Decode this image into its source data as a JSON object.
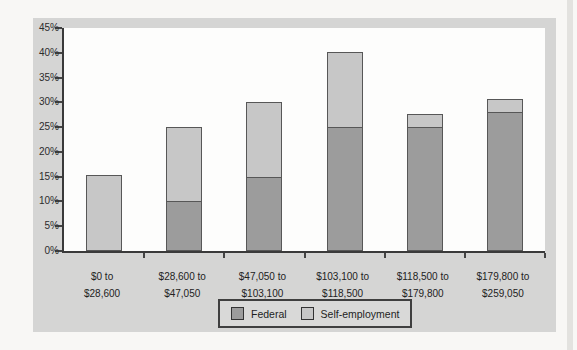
{
  "colors": {
    "panel_bg": "#d5d5d4",
    "plot_bg": "#fdfdfc",
    "axis": "#3a3a3a",
    "federal": "#9c9c9c",
    "self_employment": "#c7c7c7",
    "text": "#222222"
  },
  "chart_data": {
    "type": "bar",
    "stacked": true,
    "title": "",
    "xlabel": "",
    "ylabel": "",
    "ylim": [
      0,
      45
    ],
    "y_step": 5,
    "grid": false,
    "legend_position": "bottom-center",
    "y_tick_labels": [
      "45%",
      "40%",
      "35%",
      "30%",
      "25%",
      "20%",
      "15%",
      "10%",
      "5%",
      "0%"
    ],
    "categories": [
      {
        "line1": "$0 to",
        "line2": "$28,600"
      },
      {
        "line1": "$28,600 to",
        "line2": "$47,050"
      },
      {
        "line1": "$47,050 to",
        "line2": "$103,100"
      },
      {
        "line1": "$103,100 to",
        "line2": "$118,500"
      },
      {
        "line1": "$118,500 to",
        "line2": "$179,800"
      },
      {
        "line1": "$179,800 to",
        "line2": "$259,050"
      }
    ],
    "series": [
      {
        "name": "Federal",
        "color": "#9c9c9c",
        "values": [
          0,
          10,
          15,
          25,
          25,
          28
        ]
      },
      {
        "name": "Self-employment",
        "color": "#c7c7c7",
        "values": [
          15.3,
          15.3,
          15.3,
          15.3,
          2.9,
          2.9
        ]
      }
    ],
    "totals": [
      15.3,
      25.3,
      30.3,
      40.3,
      27.9,
      30.9
    ]
  },
  "legend": {
    "federal_label": "Federal",
    "self_employment_label": "Self-employment"
  }
}
